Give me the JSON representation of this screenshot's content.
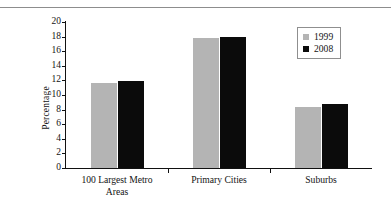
{
  "chart_data": {
    "type": "bar",
    "title": "",
    "subtitle": "",
    "xlabel": "",
    "ylabel": "Percentage",
    "ylim": [
      0,
      20
    ],
    "ytick_labels": [
      "0",
      "2",
      "4",
      "6",
      "8",
      "10",
      "12",
      "14",
      "16",
      "18",
      "20"
    ],
    "ytick_values": [
      0,
      2,
      4,
      6,
      8,
      10,
      12,
      14,
      16,
      18,
      20
    ],
    "grid": false,
    "legend_position": "top-right",
    "categories": [
      "100 Largest Metro\nAreas",
      "Primary Cities",
      "Suburbs"
    ],
    "series": [
      {
        "name": "1999",
        "color": "#b4b4b4",
        "values": [
          11.6,
          17.8,
          8.4
        ]
      },
      {
        "name": "2008",
        "color": "#0b0b0b",
        "values": [
          11.9,
          18.0,
          8.8
        ]
      }
    ]
  },
  "legend": {
    "entries": [
      {
        "label": "1999",
        "swatch": "gray-square-swatch"
      },
      {
        "label": "2008",
        "swatch": "black-square-swatch"
      }
    ]
  },
  "axes": {
    "y_title": "Percentage"
  }
}
